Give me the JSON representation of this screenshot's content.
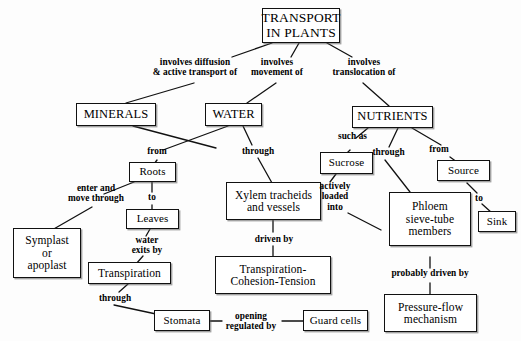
{
  "diagram": {
    "title": "TRANSPORT IN PLANTS",
    "type": "concept-map",
    "background_color": "#fdfdfd",
    "box_border_color": "#111111",
    "text_color": "#000000"
  },
  "nodes": {
    "transport": "TRANSPORT\nIN PLANTS",
    "minerals": "MINERALS",
    "water": "WATER",
    "nutrients": "NUTRIENTS",
    "roots": "Roots",
    "leaves": "Leaves",
    "xylem": "Xylem tracheids\nand vessels",
    "symplast": "Symplast\nor\napoplast",
    "transpiration": "Transpiration",
    "tct": "Transpiration-\nCohesion-Tension",
    "stomata": "Stomata",
    "guard_cells": "Guard cells",
    "sucrose": "Sucrose",
    "source": "Source",
    "sink": "Sink",
    "phloem": "Phloem\nsieve-tube\nmembers",
    "pressure_flow": "Pressure-flow\nmechanism"
  },
  "link_labels": {
    "involves_diffusion": "involves diffusion\n& active transport of",
    "involves_movement": "involves\nmovement of",
    "involves_translocation": "involves\ntranslocation of",
    "from": "from",
    "through_water": "through",
    "to_leaves": "to",
    "enter_and_move_through": "enter and\nmove through",
    "water_exits_by": "water\nexits by",
    "driven_by": "driven by",
    "through_stomata": "through",
    "opening_regulated_by": "opening\nregulated by",
    "such_as": "such as",
    "through_phloem": "through",
    "from_source": "from",
    "to_sink": "to",
    "actively_loaded_into": "actively\nloaded\ninto",
    "probably_driven_by": "probably driven by"
  }
}
